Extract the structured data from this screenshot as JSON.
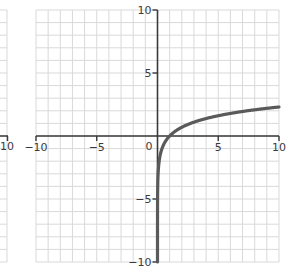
{
  "chart_data": {
    "type": "line",
    "title": "",
    "xlabel": "",
    "ylabel": "",
    "function": "y = ln(x)",
    "xlim": [
      -10,
      10
    ],
    "ylim": [
      -10,
      10
    ],
    "grid": true,
    "grid_step": 1,
    "x_ticks": [
      -10,
      -5,
      0,
      5,
      10
    ],
    "y_ticks": [
      10,
      5,
      -5,
      -10
    ],
    "x_tick_labels": [
      "−10",
      "−5",
      "0",
      "5",
      "10"
    ],
    "y_tick_labels": [
      "10",
      "5",
      "−5",
      "−10"
    ],
    "origin_label": "0",
    "series": [
      {
        "name": "ln(x)",
        "x": [
          4.54e-05,
          0.001,
          0.01,
          0.05,
          0.1,
          0.2,
          0.5,
          1,
          2,
          3,
          4,
          5,
          6,
          7,
          8,
          9,
          10
        ],
        "values": [
          -10,
          -6.91,
          -4.61,
          -3.0,
          -2.3,
          -1.61,
          -0.69,
          0,
          0.69,
          1.1,
          1.39,
          1.61,
          1.79,
          1.95,
          2.08,
          2.2,
          2.3
        ]
      }
    ],
    "left_partial_panel": {
      "visible_x_tick_label": "10"
    }
  },
  "colors": {
    "curve": "#5a5a5a",
    "axis": "#3a3a3a",
    "grid": "#d9d9d9",
    "background": "#ffffff",
    "label": "#3a3a3a"
  }
}
